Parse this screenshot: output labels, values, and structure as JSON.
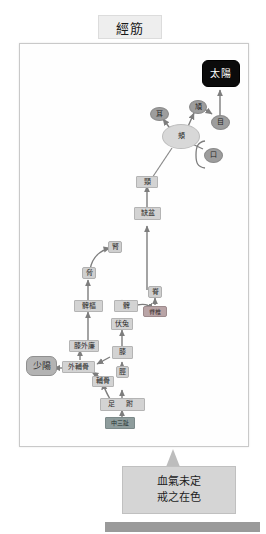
{
  "header": {
    "title": "經筋"
  },
  "diagram": {
    "type": "flow-diagram",
    "nodes": [
      {
        "id": "taiyang",
        "label": "太陽",
        "shape": "black-rounded-box",
        "color": "#0b0b0b"
      },
      {
        "id": "ear",
        "label": "耳",
        "shape": "ellipse-dark",
        "color": "#9d9d9d"
      },
      {
        "id": "cheekbone",
        "label": "頄",
        "shape": "ellipse-dark",
        "color": "#9d9d9d"
      },
      {
        "id": "eye",
        "label": "目",
        "shape": "ellipse-dark",
        "color": "#9d9d9d"
      },
      {
        "id": "cheek",
        "label": "頰",
        "shape": "ellipse",
        "color": "#d8d8d8"
      },
      {
        "id": "mouth",
        "label": "口",
        "shape": "ellipse-dark",
        "color": "#9d9d9d"
      },
      {
        "id": "neck",
        "label": "頸",
        "shape": "rect",
        "color": "#d3d3d3"
      },
      {
        "id": "quepen",
        "label": "缺盆",
        "shape": "rect",
        "color": "#d3d3d3"
      },
      {
        "id": "kidney",
        "label": "腎",
        "shape": "rect-sm",
        "color": "#cfcfcf"
      },
      {
        "id": "rib",
        "label": "脅",
        "shape": "rect-sm",
        "color": "#cfcfcf"
      },
      {
        "id": "pivot",
        "label": "髀樞",
        "shape": "rect",
        "color": "#d3d3d3"
      },
      {
        "id": "thigh",
        "label": "髀",
        "shape": "rect",
        "color": "#d3d3d3"
      },
      {
        "id": "spine",
        "label": "脊",
        "shape": "rect-sm",
        "color": "#cfcfcf"
      },
      {
        "id": "jizhu",
        "label": "脊椎",
        "shape": "pink-box",
        "color": "#b9a4a6"
      },
      {
        "id": "futu",
        "label": "伏兔",
        "shape": "rect",
        "color": "#d3d3d3"
      },
      {
        "id": "kneeouter",
        "label": "膝外廉",
        "shape": "rect",
        "color": "#d3d3d3"
      },
      {
        "id": "knee",
        "label": "膝",
        "shape": "rect",
        "color": "#d3d3d3"
      },
      {
        "id": "fubugu",
        "label": "外輔骨",
        "shape": "rect",
        "color": "#d3d3d3"
      },
      {
        "id": "bugu",
        "label": "輔骨",
        "shape": "rect",
        "color": "#d3d3d3"
      },
      {
        "id": "shaoyang",
        "label": "少陽",
        "shape": "round-box",
        "color": "#b3b3b3"
      },
      {
        "id": "shin",
        "label": "脛",
        "shape": "rect-sm",
        "color": "#cfcfcf"
      },
      {
        "id": "zufu",
        "label": "足   跗",
        "shape": "rect",
        "color": "#c4c4c4"
      },
      {
        "id": "thirdtoe",
        "label": "中三趾",
        "shape": "teal-box",
        "color": "#8e9c9c"
      }
    ],
    "edges": [
      {
        "from": "eye",
        "to": "taiyang"
      },
      {
        "from": "cheekbone",
        "to": "eye"
      },
      {
        "from": "cheek",
        "to": "cheekbone"
      },
      {
        "from": "cheek",
        "to": "ear"
      },
      {
        "from": "cheek",
        "to": "mouth"
      },
      {
        "from": "neck",
        "to": "cheek"
      },
      {
        "from": "quepen",
        "to": "neck"
      },
      {
        "from": "spine",
        "to": "quepen"
      },
      {
        "from": "jizhu",
        "to": "spine"
      },
      {
        "from": "thigh",
        "to": "jizhu"
      },
      {
        "from": "rib",
        "to": "kidney"
      },
      {
        "from": "pivot",
        "to": "rib"
      },
      {
        "from": "kneeouter",
        "to": "pivot"
      },
      {
        "from": "fubugu",
        "to": "kneeouter"
      },
      {
        "from": "fubugu",
        "to": "shaoyang"
      },
      {
        "from": "knee",
        "to": "futu"
      },
      {
        "from": "futu",
        "to": "thigh"
      },
      {
        "from": "shin",
        "to": "knee"
      },
      {
        "from": "knee",
        "to": "fubugu"
      },
      {
        "from": "bugu",
        "to": "fubugu"
      },
      {
        "from": "zufu",
        "to": "shin"
      },
      {
        "from": "zufu",
        "to": "bugu"
      },
      {
        "from": "thirdtoe",
        "to": "zufu"
      }
    ]
  },
  "callout": {
    "line1": "血氣未定",
    "line2": "戒之在色"
  }
}
